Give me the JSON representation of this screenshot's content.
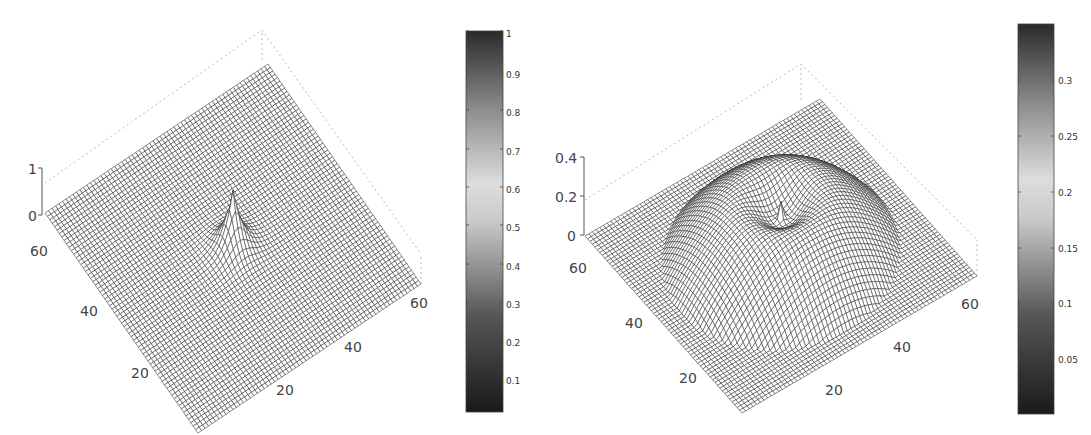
{
  "chart_data": [
    {
      "type": "surface",
      "title": "",
      "description": "3D mesh surface over a 64x64 grid, flat at 0 with a single sharp peak at the center reaching 1",
      "xlabel": "",
      "ylabel": "",
      "zlabel": "",
      "x_ticks": [
        "20",
        "40",
        "60"
      ],
      "y_ticks": [
        "20",
        "40",
        "60"
      ],
      "z_ticks": [
        "0",
        "1"
      ],
      "zlim": [
        0,
        1
      ],
      "grid_size": [
        64,
        64
      ],
      "peak": {
        "x": 32,
        "y": 32,
        "z": 1
      },
      "colorbar": {
        "ticks": [
          "0.1",
          "0.2",
          "0.3",
          "0.4",
          "0.5",
          "0.6",
          "0.7",
          "0.8",
          "0.9",
          "1"
        ],
        "range": [
          0,
          1
        ],
        "colormap": "gray-diverging"
      }
    },
    {
      "type": "surface",
      "title": "",
      "description": "3D mesh surface over a 64x64 grid: a broad circular dome with a central dip containing a thin spike",
      "xlabel": "",
      "ylabel": "",
      "zlabel": "",
      "x_ticks": [
        "20",
        "40",
        "60"
      ],
      "y_ticks": [
        "20",
        "40",
        "60"
      ],
      "z_ticks": [
        "0",
        "0.2",
        "0.4"
      ],
      "zlim": [
        0,
        0.4
      ],
      "grid_size": [
        64,
        64
      ],
      "peak": {
        "z": 0.34
      },
      "colorbar": {
        "ticks": [
          "0.05",
          "0.1",
          "0.15",
          "0.2",
          "0.25",
          "0.3"
        ],
        "range": [
          0,
          0.34
        ],
        "colormap": "gray-diverging"
      }
    }
  ],
  "plots": {
    "left": {
      "z_labels": [
        "0",
        "1"
      ],
      "y_labels": [
        "60",
        "40",
        "20"
      ],
      "x_labels": [
        "20",
        "40",
        "60"
      ],
      "colorbar_labels": [
        "1",
        "0.9",
        "0.8",
        "0.7",
        "0.6",
        "0.5",
        "0.4",
        "0.3",
        "0.2",
        "0.1"
      ]
    },
    "right": {
      "z_labels": [
        "0",
        "0.2",
        "0.4"
      ],
      "y_labels": [
        "60",
        "40",
        "20"
      ],
      "x_labels": [
        "20",
        "40",
        "60"
      ],
      "colorbar_labels": [
        "0.3",
        "0.25",
        "0.2",
        "0.15",
        "0.1",
        "0.05"
      ]
    }
  },
  "colors": {
    "mesh_line": "#222222",
    "mesh_face": "#ffffff",
    "axis": "#555555",
    "box_dotted": "#bbbbbb"
  }
}
